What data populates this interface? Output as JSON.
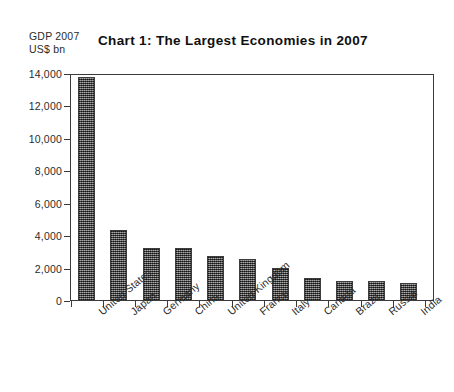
{
  "chart_data": {
    "type": "bar",
    "title": "Chart 1: The Largest Economies in 2007",
    "axis_caption": "GDP 2007\nUS$ bn",
    "xlabel": "",
    "ylabel": "GDP 2007 US$ bn",
    "ylim": [
      0,
      14000
    ],
    "grid": false,
    "legend": "none",
    "ytick_labels": [
      "14,000",
      "12,000",
      "10,000",
      "8,000",
      "6,000",
      "4,000",
      "2,000",
      "0"
    ],
    "ytick_values": [
      14000,
      12000,
      10000,
      8000,
      6000,
      4000,
      2000,
      0
    ],
    "categories": [
      "United States",
      "Japan",
      "Germany",
      "China",
      "United Kingdom",
      "France",
      "Italy",
      "Canada",
      "Brazil",
      "Russia",
      "India"
    ],
    "values": [
      13800,
      4400,
      3300,
      3250,
      2750,
      2600,
      2050,
      1400,
      1250,
      1250,
      1100
    ],
    "bar_color": "#555555"
  },
  "colors": {
    "background": "#ffffff",
    "axis": "#3a3a3a",
    "text": "#2b2b2b",
    "title": "#101010",
    "bar_fill": "#555555"
  }
}
